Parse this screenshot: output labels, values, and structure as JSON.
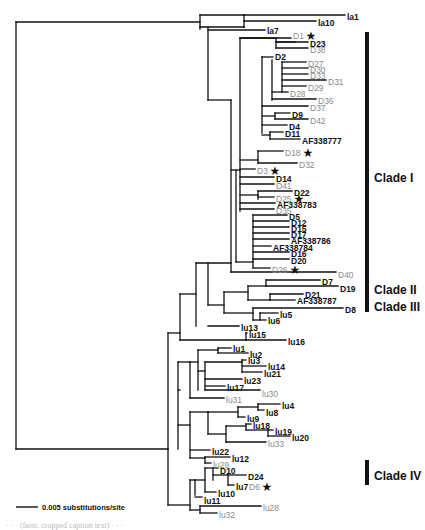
{
  "figure": {
    "type": "phylogenetic-tree",
    "scale_bar": {
      "label": "0.005 substitutions/site"
    },
    "clades": [
      {
        "name": "Clade I",
        "y1": 32,
        "y2": 312,
        "label_y": 182
      },
      {
        "name": "Clade II",
        "y1": 282,
        "y2": 300,
        "label_y": 294
      },
      {
        "name": "Clade III",
        "y1": 302,
        "y2": 312,
        "label_y": 311
      },
      {
        "name": "Clade IV",
        "y1": 460,
        "y2": 485,
        "label_y": 480
      }
    ],
    "leaves": [
      {
        "t": "la1",
        "x": 347,
        "y": 17,
        "s": "b"
      },
      {
        "t": "la10",
        "x": 318,
        "y": 23,
        "s": "b"
      },
      {
        "t": "la7",
        "x": 267,
        "y": 31,
        "s": "b"
      },
      {
        "t": "D1",
        "x": 293,
        "y": 36,
        "s": "g",
        "star": true
      },
      {
        "t": "D23",
        "x": 310,
        "y": 44,
        "s": "b"
      },
      {
        "t": "D38",
        "x": 310,
        "y": 50,
        "s": "g"
      },
      {
        "t": "D2",
        "x": 275,
        "y": 57,
        "s": "b"
      },
      {
        "t": "D27",
        "x": 308,
        "y": 64,
        "s": "g"
      },
      {
        "t": "D30",
        "x": 310,
        "y": 70,
        "s": "g"
      },
      {
        "t": "D33",
        "x": 310,
        "y": 76,
        "s": "g"
      },
      {
        "t": "D31",
        "x": 328,
        "y": 82,
        "s": "g"
      },
      {
        "t": "D29",
        "x": 308,
        "y": 88,
        "s": "g"
      },
      {
        "t": "D28",
        "x": 290,
        "y": 94,
        "s": "g"
      },
      {
        "t": "D36",
        "x": 318,
        "y": 101,
        "s": "g"
      },
      {
        "t": "D37",
        "x": 310,
        "y": 108,
        "s": "g"
      },
      {
        "t": "D9",
        "x": 292,
        "y": 115,
        "s": "b"
      },
      {
        "t": "D42",
        "x": 310,
        "y": 121,
        "s": "g"
      },
      {
        "t": "D4",
        "x": 289,
        "y": 127,
        "s": "b"
      },
      {
        "t": "D11",
        "x": 285,
        "y": 134,
        "s": "b"
      },
      {
        "t": "AF338777",
        "x": 302,
        "y": 141,
        "s": "b"
      },
      {
        "t": "D18",
        "x": 285,
        "y": 153,
        "s": "g",
        "star": true
      },
      {
        "t": "D32",
        "x": 299,
        "y": 165,
        "s": "g"
      },
      {
        "t": "D3",
        "x": 257,
        "y": 171,
        "s": "g",
        "star": true
      },
      {
        "t": "D14",
        "x": 276,
        "y": 179,
        "s": "b"
      },
      {
        "t": "D41",
        "x": 276,
        "y": 186,
        "s": "g"
      },
      {
        "t": "D22",
        "x": 294,
        "y": 193,
        "s": "b"
      },
      {
        "t": "D25",
        "x": 276,
        "y": 199,
        "s": "g",
        "star": true
      },
      {
        "t": "AF338783",
        "x": 277,
        "y": 205,
        "s": "b"
      },
      {
        "t": "D35",
        "x": 276,
        "y": 211,
        "s": "g"
      },
      {
        "t": "D5",
        "x": 289,
        "y": 217,
        "s": "b"
      },
      {
        "t": "D12",
        "x": 291,
        "y": 223,
        "s": "b"
      },
      {
        "t": "D15",
        "x": 291,
        "y": 229,
        "s": "b"
      },
      {
        "t": "D17",
        "x": 291,
        "y": 235,
        "s": "b"
      },
      {
        "t": "AF338786",
        "x": 291,
        "y": 241,
        "s": "b"
      },
      {
        "t": "AF338784",
        "x": 273,
        "y": 248,
        "s": "b"
      },
      {
        "t": "D16",
        "x": 291,
        "y": 254,
        "s": "b"
      },
      {
        "t": "D20",
        "x": 291,
        "y": 261,
        "s": "b"
      },
      {
        "t": "D26",
        "x": 272,
        "y": 270,
        "s": "g",
        "star": true
      },
      {
        "t": "D40",
        "x": 338,
        "y": 275,
        "s": "g"
      },
      {
        "t": "D7",
        "x": 322,
        "y": 282,
        "s": "b"
      },
      {
        "t": "D19",
        "x": 340,
        "y": 289,
        "s": "b"
      },
      {
        "t": "D21",
        "x": 305,
        "y": 295,
        "s": "b"
      },
      {
        "t": "AF338787",
        "x": 297,
        "y": 301,
        "s": "b"
      },
      {
        "t": "D8",
        "x": 345,
        "y": 310,
        "s": "b"
      },
      {
        "t": "lu5",
        "x": 280,
        "y": 315,
        "s": "b"
      },
      {
        "t": "lu6",
        "x": 268,
        "y": 321,
        "s": "b"
      },
      {
        "t": "lu13",
        "x": 241,
        "y": 328,
        "s": "b"
      },
      {
        "t": "lu15",
        "x": 249,
        "y": 335,
        "s": "b"
      },
      {
        "t": "lu16",
        "x": 288,
        "y": 342,
        "s": "b"
      },
      {
        "t": "lu1",
        "x": 233,
        "y": 349,
        "s": "b"
      },
      {
        "t": "lu2",
        "x": 250,
        "y": 355,
        "s": "b"
      },
      {
        "t": "lu3",
        "x": 248,
        "y": 361,
        "s": "b"
      },
      {
        "t": "lu14",
        "x": 268,
        "y": 367,
        "s": "b"
      },
      {
        "t": "lu21",
        "x": 264,
        "y": 374,
        "s": "b"
      },
      {
        "t": "lu23",
        "x": 244,
        "y": 381,
        "s": "b"
      },
      {
        "t": "lu17",
        "x": 227,
        "y": 388,
        "s": "b"
      },
      {
        "t": "lu30",
        "x": 262,
        "y": 394,
        "s": "g"
      },
      {
        "t": "lu31",
        "x": 226,
        "y": 400,
        "s": "g"
      },
      {
        "t": "lu4",
        "x": 282,
        "y": 406,
        "s": "b"
      },
      {
        "t": "lu8",
        "x": 266,
        "y": 413,
        "s": "b"
      },
      {
        "t": "lu9",
        "x": 247,
        "y": 419,
        "s": "b"
      },
      {
        "t": "lu18",
        "x": 253,
        "y": 426,
        "s": "b"
      },
      {
        "t": "lu19",
        "x": 275,
        "y": 432,
        "s": "b"
      },
      {
        "t": "lu20",
        "x": 292,
        "y": 438,
        "s": "b"
      },
      {
        "t": "lu33",
        "x": 268,
        "y": 444,
        "s": "g"
      },
      {
        "t": "lu22",
        "x": 212,
        "y": 452,
        "s": "b"
      },
      {
        "t": "lu12",
        "x": 232,
        "y": 459,
        "s": "b"
      },
      {
        "t": "lu29",
        "x": 213,
        "y": 465,
        "s": "g"
      },
      {
        "t": "D10",
        "x": 220,
        "y": 471,
        "s": "b"
      },
      {
        "t": "D24",
        "x": 248,
        "y": 477,
        "s": "b"
      },
      {
        "t": "lu7",
        "x": 236,
        "y": 487,
        "s": "b"
      },
      {
        "t": "D6",
        "x": 249,
        "y": 487,
        "s": "g",
        "star": true
      },
      {
        "t": "lu10",
        "x": 218,
        "y": 494,
        "s": "b"
      },
      {
        "t": "lu11",
        "x": 204,
        "y": 501,
        "s": "b"
      },
      {
        "t": "lu28",
        "x": 263,
        "y": 508,
        "s": "g"
      },
      {
        "t": "lu32",
        "x": 219,
        "y": 515,
        "s": "g"
      }
    ],
    "caption_fragment": "· · · (faint, cropped caption text) · · ·"
  }
}
